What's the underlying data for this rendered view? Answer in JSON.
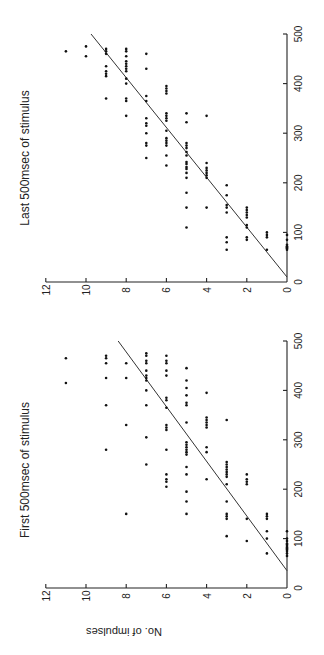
{
  "figure": {
    "orientation": "rotated-90-ccw",
    "shared_ylabel": "No. of impulses"
  },
  "chart_data": [
    {
      "type": "scatter",
      "title": "Last 500msec of stimulus",
      "xlabel": "",
      "ylabel": "No. of impulses",
      "xlim": [
        0,
        500
      ],
      "ylim": [
        0,
        12
      ],
      "x_ticks": [
        "0",
        "100",
        "200",
        "300",
        "400",
        "500"
      ],
      "y_ticks": [
        "0",
        "2",
        "4",
        "6",
        "8",
        "10",
        "12"
      ],
      "grid": false,
      "fit_line": {
        "x": [
          10,
          500
        ],
        "y": [
          0,
          9.75
        ]
      },
      "points": [
        [
          65,
          0
        ],
        [
          68,
          0
        ],
        [
          70,
          0
        ],
        [
          72,
          0
        ],
        [
          75,
          0
        ],
        [
          85,
          0
        ],
        [
          95,
          0
        ],
        [
          65,
          1
        ],
        [
          90,
          1
        ],
        [
          95,
          1
        ],
        [
          100,
          1
        ],
        [
          85,
          2
        ],
        [
          90,
          2
        ],
        [
          110,
          2
        ],
        [
          115,
          2
        ],
        [
          130,
          2
        ],
        [
          135,
          2
        ],
        [
          140,
          2
        ],
        [
          145,
          2
        ],
        [
          150,
          2
        ],
        [
          65,
          3
        ],
        [
          80,
          3
        ],
        [
          90,
          3
        ],
        [
          140,
          3
        ],
        [
          150,
          3
        ],
        [
          155,
          3
        ],
        [
          175,
          3
        ],
        [
          195,
          3
        ],
        [
          150,
          4
        ],
        [
          210,
          4
        ],
        [
          215,
          4
        ],
        [
          220,
          4
        ],
        [
          225,
          4
        ],
        [
          230,
          4
        ],
        [
          240,
          4
        ],
        [
          335,
          4
        ],
        [
          110,
          5
        ],
        [
          150,
          5
        ],
        [
          180,
          5
        ],
        [
          210,
          5
        ],
        [
          220,
          5
        ],
        [
          228,
          5
        ],
        [
          232,
          5
        ],
        [
          238,
          5
        ],
        [
          242,
          5
        ],
        [
          255,
          5
        ],
        [
          262,
          5
        ],
        [
          270,
          5
        ],
        [
          275,
          5
        ],
        [
          280,
          5
        ],
        [
          322,
          5
        ],
        [
          340,
          5
        ],
        [
          235,
          6
        ],
        [
          255,
          6
        ],
        [
          275,
          6
        ],
        [
          280,
          6
        ],
        [
          285,
          6
        ],
        [
          290,
          6
        ],
        [
          305,
          6
        ],
        [
          325,
          6
        ],
        [
          330,
          6
        ],
        [
          335,
          6
        ],
        [
          340,
          6
        ],
        [
          380,
          6
        ],
        [
          385,
          6
        ],
        [
          390,
          6
        ],
        [
          395,
          6
        ],
        [
          250,
          7
        ],
        [
          275,
          7
        ],
        [
          280,
          7
        ],
        [
          300,
          7
        ],
        [
          315,
          7
        ],
        [
          320,
          7
        ],
        [
          330,
          7
        ],
        [
          365,
          7
        ],
        [
          375,
          7
        ],
        [
          430,
          7
        ],
        [
          460,
          7
        ],
        [
          335,
          8
        ],
        [
          365,
          8
        ],
        [
          370,
          8
        ],
        [
          400,
          8
        ],
        [
          410,
          8
        ],
        [
          425,
          8
        ],
        [
          430,
          8
        ],
        [
          435,
          8
        ],
        [
          440,
          8
        ],
        [
          445,
          8
        ],
        [
          455,
          8
        ],
        [
          465,
          8
        ],
        [
          470,
          8
        ],
        [
          370,
          9
        ],
        [
          415,
          9
        ],
        [
          420,
          9
        ],
        [
          425,
          9
        ],
        [
          435,
          9
        ],
        [
          460,
          9
        ],
        [
          465,
          9
        ],
        [
          470,
          9
        ],
        [
          455,
          10
        ],
        [
          475,
          10
        ],
        [
          465,
          11
        ]
      ]
    },
    {
      "type": "scatter",
      "title": "First 500msec of stimulus",
      "xlabel": "",
      "ylabel": "No. of impulses",
      "xlim": [
        0,
        500
      ],
      "ylim": [
        0,
        12
      ],
      "x_ticks": [
        "0",
        "100",
        "200",
        "300",
        "400",
        "500"
      ],
      "y_ticks": [
        "0",
        "2",
        "4",
        "6",
        "8",
        "10",
        "12"
      ],
      "grid": false,
      "fit_line": {
        "x": [
          35,
          500
        ],
        "y": [
          0,
          8.4
        ]
      },
      "points": [
        [
          65,
          0
        ],
        [
          70,
          0
        ],
        [
          75,
          0
        ],
        [
          78,
          0
        ],
        [
          80,
          0
        ],
        [
          82,
          0
        ],
        [
          85,
          0
        ],
        [
          88,
          0
        ],
        [
          90,
          0
        ],
        [
          95,
          0
        ],
        [
          100,
          0
        ],
        [
          115,
          0
        ],
        [
          70,
          1
        ],
        [
          100,
          1
        ],
        [
          115,
          1
        ],
        [
          140,
          1
        ],
        [
          145,
          1
        ],
        [
          150,
          1
        ],
        [
          95,
          2
        ],
        [
          140,
          2
        ],
        [
          210,
          2
        ],
        [
          215,
          2
        ],
        [
          220,
          2
        ],
        [
          230,
          2
        ],
        [
          105,
          3
        ],
        [
          140,
          3
        ],
        [
          145,
          3
        ],
        [
          150,
          3
        ],
        [
          175,
          3
        ],
        [
          210,
          3
        ],
        [
          225,
          3
        ],
        [
          230,
          3
        ],
        [
          235,
          3
        ],
        [
          240,
          3
        ],
        [
          245,
          3
        ],
        [
          250,
          3
        ],
        [
          255,
          3
        ],
        [
          340,
          3
        ],
        [
          220,
          4
        ],
        [
          275,
          4
        ],
        [
          285,
          4
        ],
        [
          325,
          4
        ],
        [
          330,
          4
        ],
        [
          335,
          4
        ],
        [
          340,
          4
        ],
        [
          345,
          4
        ],
        [
          395,
          4
        ],
        [
          150,
          5
        ],
        [
          175,
          5
        ],
        [
          195,
          5
        ],
        [
          230,
          5
        ],
        [
          245,
          5
        ],
        [
          270,
          5
        ],
        [
          275,
          5
        ],
        [
          280,
          5
        ],
        [
          285,
          5
        ],
        [
          290,
          5
        ],
        [
          295,
          5
        ],
        [
          335,
          5
        ],
        [
          370,
          5
        ],
        [
          375,
          5
        ],
        [
          390,
          5
        ],
        [
          405,
          5
        ],
        [
          420,
          5
        ],
        [
          445,
          5
        ],
        [
          205,
          6
        ],
        [
          215,
          6
        ],
        [
          220,
          6
        ],
        [
          230,
          6
        ],
        [
          280,
          6
        ],
        [
          320,
          6
        ],
        [
          325,
          6
        ],
        [
          330,
          6
        ],
        [
          365,
          6
        ],
        [
          380,
          6
        ],
        [
          385,
          6
        ],
        [
          430,
          6
        ],
        [
          440,
          6
        ],
        [
          455,
          6
        ],
        [
          460,
          6
        ],
        [
          470,
          6
        ],
        [
          250,
          7
        ],
        [
          305,
          7
        ],
        [
          370,
          7
        ],
        [
          400,
          7
        ],
        [
          420,
          7
        ],
        [
          425,
          7
        ],
        [
          430,
          7
        ],
        [
          440,
          7
        ],
        [
          455,
          7
        ],
        [
          460,
          7
        ],
        [
          470,
          7
        ],
        [
          475,
          7
        ],
        [
          150,
          8
        ],
        [
          330,
          8
        ],
        [
          425,
          8
        ],
        [
          455,
          8
        ],
        [
          280,
          9
        ],
        [
          370,
          9
        ],
        [
          425,
          9
        ],
        [
          455,
          9
        ],
        [
          465,
          9
        ],
        [
          470,
          9
        ],
        [
          415,
          11
        ],
        [
          465,
          11
        ]
      ]
    }
  ],
  "colors": {
    "background": "#ffffff",
    "ink": "#111111"
  }
}
